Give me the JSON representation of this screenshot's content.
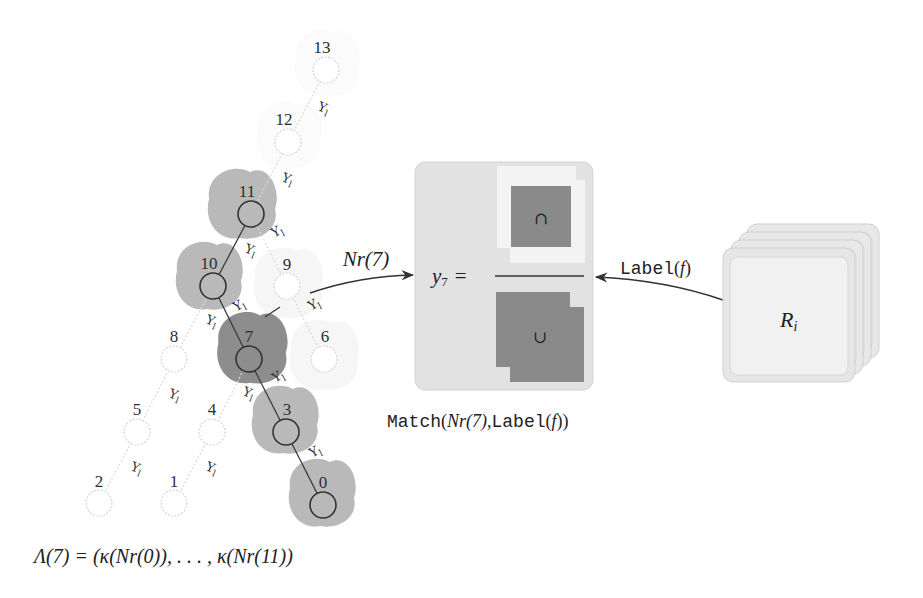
{
  "tree": {
    "nodes": [
      {
        "label": "13",
        "state": "inactive"
      },
      {
        "label": "12",
        "state": "inactive"
      },
      {
        "label": "11",
        "state": "in-sequence"
      },
      {
        "label": "10",
        "state": "in-sequence"
      },
      {
        "label": "9",
        "state": "inactive"
      },
      {
        "label": "8",
        "state": "inactive"
      },
      {
        "label": "7",
        "state": "current"
      },
      {
        "label": "6",
        "state": "inactive"
      },
      {
        "label": "5",
        "state": "inactive"
      },
      {
        "label": "4",
        "state": "inactive"
      },
      {
        "label": "3",
        "state": "in-sequence"
      },
      {
        "label": "2",
        "state": "inactive"
      },
      {
        "label": "1",
        "state": "inactive"
      },
      {
        "label": "0",
        "state": "in-sequence"
      }
    ],
    "edges": [
      [
        "13",
        "12"
      ],
      [
        "12",
        "11"
      ],
      [
        "11",
        "10"
      ],
      [
        "11",
        "9"
      ],
      [
        "10",
        "8"
      ],
      [
        "10",
        "7"
      ],
      [
        "9",
        "6"
      ],
      [
        "8",
        "5"
      ],
      [
        "7",
        "4"
      ],
      [
        "7",
        "3"
      ],
      [
        "5",
        "2"
      ],
      [
        "4",
        "1"
      ],
      [
        "3",
        "0"
      ]
    ],
    "edge_label": {
      "symbol": "Υ",
      "sub": "l"
    }
  },
  "neighborhood_arrow": {
    "label": "Nr(7)"
  },
  "match_box": {
    "lhs": "y",
    "lhs_sub": "7",
    "equals": "=",
    "intersection_symbol": "∩",
    "union_symbol": "∪"
  },
  "match_caption": {
    "func": "Match",
    "open": "(",
    "arg1": "Nr(7)",
    "comma": ",",
    "arg2_func": "Label",
    "arg2_open": "(",
    "arg2_var": "f",
    "close": "))"
  },
  "label_arrow": {
    "func": "Label",
    "open": "(",
    "var": "f",
    "close": ")"
  },
  "region_stack": {
    "symbol": "R",
    "sub": "i",
    "count": 4
  },
  "sequence_caption": {
    "text": "Λ(7) = (κ(Nr(0)), . . . , κ(Nr(11))"
  },
  "colors": {
    "blob_sequence": "#b9b9b9",
    "blob_current": "#8d8d8d",
    "blob_faint": "#f5f5f5",
    "box_fill": "#e2e2e2",
    "overlap_dark": "#8a8a8a",
    "card_fill": "#e6e6e6"
  }
}
